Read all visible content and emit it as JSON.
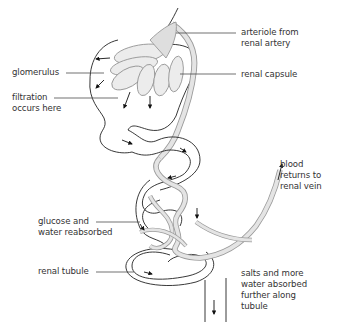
{
  "labels": {
    "glomerulus": "glomerulus",
    "filtration": "filtration\noccurs here",
    "arteriole": "arteriole from\nrenal artery",
    "renal_capsule": "renal capsule",
    "blood_returns": "blood\nreturns to\nrenal vein",
    "glucose": "glucose and\nwater reabsorbed",
    "renal_tubule": "renal tubule",
    "salts": "salts and more\nwater absorbed\nfurther along\ntubule"
  },
  "colors": {
    "line": "#222222",
    "vessel_fill": "#e4e4e4",
    "vessel_stroke": "#9a9a9a",
    "text": "#333333"
  }
}
